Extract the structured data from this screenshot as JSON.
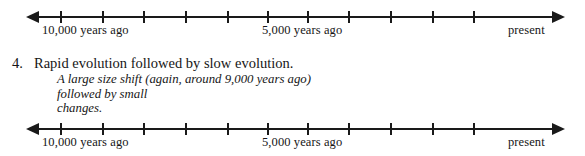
{
  "colors": {
    "ink": "#161616",
    "axis": "#1a1a1a",
    "background": "#ffffff"
  },
  "timeline": {
    "tick_count": 11,
    "labels": [
      {
        "text": "10,000 years ago",
        "x": 42
      },
      {
        "text": "5,000 years ago",
        "x": 262
      },
      {
        "text": "present",
        "x": 508
      }
    ],
    "left_arrow_name": "timeline-left-arrow",
    "right_arrow_name": "timeline-right-arrow"
  },
  "timeline_top": {
    "caption": "timeline-top"
  },
  "timeline_bottom": {
    "caption": "timeline-bottom"
  },
  "item": {
    "number": "4.",
    "title": "Rapid evolution followed by slow evolution.",
    "description_line_1": "A large size shift (again, around 9,000 years ago) followed by small",
    "description_line_2": "changes."
  }
}
